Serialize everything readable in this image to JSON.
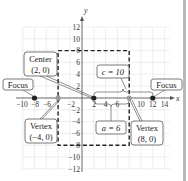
{
  "diagram": {
    "type": "hyperbola-annotated",
    "axes": {
      "x_label": "x",
      "y_label": "y",
      "x_ticks": [
        {
          "value": -10,
          "label": "−10"
        },
        {
          "value": -8,
          "label": "−8"
        },
        {
          "value": -6,
          "label": "−6"
        },
        {
          "value": -2,
          "label": "−2"
        },
        {
          "value": 2,
          "label": "2"
        },
        {
          "value": 4,
          "label": "4"
        },
        {
          "value": 6,
          "label": "6"
        },
        {
          "value": 10,
          "label": "10"
        },
        {
          "value": 12,
          "label": "12"
        },
        {
          "value": 14,
          "label": "14"
        }
      ],
      "y_ticks": [
        {
          "value": 12,
          "label": "12"
        },
        {
          "value": 10,
          "label": "10"
        },
        {
          "value": 8,
          "label": "8"
        },
        {
          "value": 6,
          "label": "6"
        },
        {
          "value": 4,
          "label": "4"
        },
        {
          "value": 2,
          "label": "2"
        },
        {
          "value": -2,
          "label": "−2"
        },
        {
          "value": -4,
          "label": "−4"
        },
        {
          "value": -6,
          "label": "−6"
        },
        {
          "value": -8,
          "label": "−8"
        },
        {
          "value": -10,
          "label": "−10"
        },
        {
          "value": -12,
          "label": "−12"
        }
      ]
    },
    "points": [
      {
        "name": "left-focus",
        "x": -8,
        "y": 0,
        "color": "#222222"
      },
      {
        "name": "left-vertex",
        "x": -4,
        "y": 0,
        "color": "#9a9a9a"
      },
      {
        "name": "center",
        "x": 2,
        "y": 0,
        "color": "#222222"
      },
      {
        "name": "right-vertex",
        "x": 8,
        "y": 0,
        "color": "#9a9a9a"
      },
      {
        "name": "right-focus",
        "x": 12,
        "y": 0,
        "color": "#222222"
      }
    ],
    "rectangle": {
      "x_min": -4,
      "x_max": 8,
      "y_min": -8,
      "y_max": 8,
      "style": "dashed"
    },
    "callouts": {
      "center": {
        "line1": "Center",
        "line2": "(2, 0)"
      },
      "left_focus": {
        "label": "Focus"
      },
      "right_focus": {
        "label": "Focus"
      },
      "c_value": {
        "label": "c = 10"
      },
      "a_value": {
        "label": "a = 6"
      },
      "left_vertex": {
        "line1": "Vertex",
        "line2": "(−4, 0)"
      },
      "right_vertex": {
        "line1": "Vertex",
        "line2": "(8, 0)"
      }
    }
  }
}
